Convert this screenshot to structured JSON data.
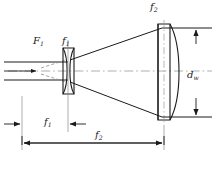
{
  "figure": {
    "type": "optical-ray-diagram",
    "background": "#ffffff",
    "line_color": "#1a1a1a",
    "axis_color": "#8a8a8a",
    "caption": ""
  },
  "labels": {
    "f2_top": {
      "base": "f",
      "sub": "2"
    },
    "F1": {
      "base": "F",
      "sub": "1"
    },
    "f1_top": {
      "base": "f",
      "sub": "1"
    },
    "dw": {
      "base": "d",
      "sub": "w"
    },
    "f1_bottom": {
      "base": "f",
      "sub": "1"
    },
    "f2_bottom": {
      "base": "f",
      "sub": "2"
    }
  },
  "elements": {
    "lens1": {
      "name": "negative-biconcave-lens",
      "label": "f1",
      "x": 68,
      "top": 48,
      "bottom": 94
    },
    "lens2": {
      "name": "positive-planoconvex-lens",
      "label": "f2",
      "x": 162,
      "top": 24,
      "bottom": 120
    },
    "optical_axis": {
      "y": 71,
      "style": "dash-dot"
    },
    "focal_point": {
      "name": "F1",
      "x": 38,
      "y": 71
    }
  },
  "dimensions": [
    {
      "name": "f1",
      "label": "f1",
      "from_x": 22,
      "to_x": 68,
      "y": 124,
      "arrows": "outward"
    },
    {
      "name": "f2",
      "label": "f2",
      "from_x": 22,
      "to_x": 162,
      "y": 143,
      "arrows": "inward"
    },
    {
      "name": "dw",
      "label": "dw",
      "x": 196,
      "from_y": 28,
      "to_y": 117,
      "arrows": "outward"
    }
  ],
  "rays": {
    "input_count": 2,
    "input_y": [
      62,
      80
    ],
    "output_y": [
      28,
      117
    ],
    "direction": "left-to-right"
  }
}
